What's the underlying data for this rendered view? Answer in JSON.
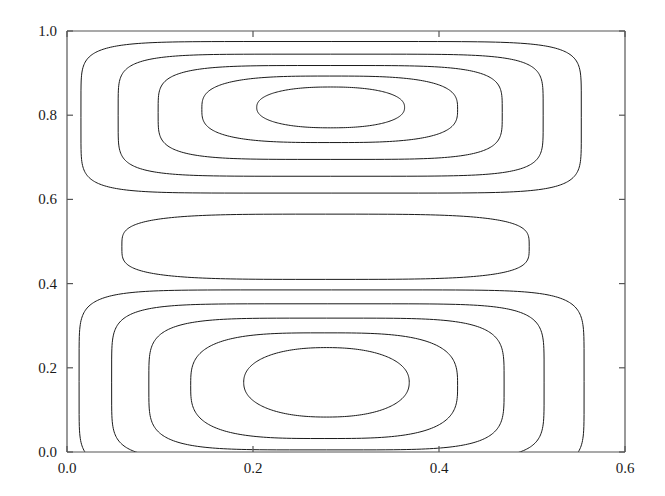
{
  "chart_data": {
    "type": "line",
    "subtype": "contour",
    "title": "",
    "xlabel": "",
    "ylabel": "",
    "xlim": [
      0.0,
      0.6
    ],
    "ylim": [
      0.0,
      1.0
    ],
    "grid": false,
    "legend": "none",
    "xticks": [
      0.0,
      0.2,
      0.4,
      0.6
    ],
    "xticklabels": [
      "0.0",
      "0.2",
      "0.4",
      "0.6"
    ],
    "yticks": [
      0.0,
      0.2,
      0.4,
      0.6,
      0.8,
      1.0
    ],
    "yticklabels": [
      "0.0",
      "0.2",
      "0.4",
      "0.6",
      "0.8",
      "1.0"
    ],
    "line_color": "#1a1a1a",
    "line_width": 1.0,
    "background_color": "#ffffff",
    "axis_color": "#555555",
    "contours": [
      {
        "group": "upper-lobe",
        "level_index": 1,
        "center": [
          0.3,
          0.82
        ],
        "x_extent": [
          0.015,
          0.553
        ],
        "y_extent": [
          0.615,
          0.975
        ],
        "squareness": 0.82
      },
      {
        "group": "upper-lobe",
        "level_index": 2,
        "center": [
          0.3,
          0.82
        ],
        "x_extent": [
          0.055,
          0.512
        ],
        "y_extent": [
          0.655,
          0.945
        ],
        "squareness": 0.62
      },
      {
        "group": "upper-lobe",
        "level_index": 3,
        "center": [
          0.3,
          0.82
        ],
        "x_extent": [
          0.098,
          0.468
        ],
        "y_extent": [
          0.695,
          0.918
        ],
        "squareness": 0.4
      },
      {
        "group": "upper-lobe",
        "level_index": 4,
        "center": [
          0.3,
          0.82
        ],
        "x_extent": [
          0.145,
          0.42
        ],
        "y_extent": [
          0.735,
          0.893
        ],
        "squareness": 0.18
      },
      {
        "group": "upper-lobe",
        "level_index": 5,
        "center": [
          0.3,
          0.82
        ],
        "x_extent": [
          0.204,
          0.363
        ],
        "y_extent": [
          0.77,
          0.867
        ],
        "squareness": 0.05
      },
      {
        "group": "middle-band",
        "level_index": 1,
        "center": [
          0.345,
          0.487
        ],
        "x_extent": [
          0.059,
          0.497
        ],
        "y_extent": [
          0.41,
          0.565
        ],
        "squareness": 0.3
      },
      {
        "group": "lower-lobe",
        "level_index": 1,
        "center": [
          0.28,
          0.17
        ],
        "x_extent": [
          0.013,
          0.556
        ],
        "y_extent": [
          -0.05,
          0.385
        ],
        "squareness": 0.86
      },
      {
        "group": "lower-lobe",
        "level_index": 2,
        "center": [
          0.28,
          0.17
        ],
        "x_extent": [
          0.048,
          0.513
        ],
        "y_extent": [
          -0.02,
          0.352
        ],
        "squareness": 0.66
      },
      {
        "group": "lower-lobe",
        "level_index": 3,
        "center": [
          0.28,
          0.17
        ],
        "x_extent": [
          0.088,
          0.47
        ],
        "y_extent": [
          0.005,
          0.318
        ],
        "squareness": 0.44
      },
      {
        "group": "lower-lobe",
        "level_index": 4,
        "center": [
          0.28,
          0.17
        ],
        "x_extent": [
          0.133,
          0.42
        ],
        "y_extent": [
          0.032,
          0.283
        ],
        "squareness": 0.2
      },
      {
        "group": "lower-lobe",
        "level_index": 5,
        "center": [
          0.28,
          0.17
        ],
        "x_extent": [
          0.19,
          0.368
        ],
        "y_extent": [
          0.083,
          0.248
        ],
        "squareness": 0.04
      }
    ]
  },
  "axes": {
    "plot_left_px": 67,
    "plot_right_px": 625,
    "plot_top_px": 31,
    "plot_bottom_px": 452
  }
}
